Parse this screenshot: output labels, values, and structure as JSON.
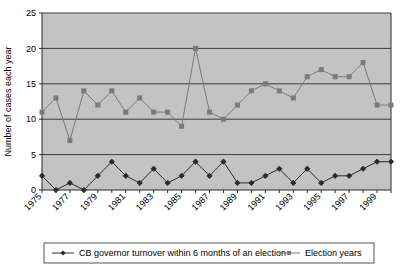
{
  "chart_data": {
    "type": "line",
    "title": "",
    "xlabel": "",
    "ylabel": "Number of cases each year",
    "ylim": [
      0,
      25
    ],
    "ytick_labels": [
      "0",
      "5",
      "10",
      "15",
      "20",
      "25"
    ],
    "yticks": [
      0,
      5,
      10,
      15,
      20,
      25
    ],
    "grid": "horizontal",
    "legend_position": "bottom",
    "plot_background": "#c3c3c3",
    "x": [
      1975,
      1976,
      1977,
      1978,
      1979,
      1980,
      1981,
      1982,
      1983,
      1984,
      1985,
      1986,
      1987,
      1988,
      1989,
      1990,
      1991,
      1992,
      1993,
      1994,
      1995,
      1996,
      1997,
      1998,
      1999,
      2000
    ],
    "xtick_labels": [
      "1975",
      "1977",
      "1979",
      "1981",
      "1983",
      "1985",
      "1987",
      "1989",
      "1991",
      "1993",
      "1995",
      "1997",
      "1999"
    ],
    "xtick_values": [
      1975,
      1977,
      1979,
      1981,
      1983,
      1985,
      1987,
      1989,
      1991,
      1993,
      1995,
      1997,
      1999
    ],
    "series": [
      {
        "name": "CB governor turnover within 6 months of an election",
        "marker": "diamond",
        "color": "#2b2b2b",
        "values": [
          2,
          0,
          1,
          0,
          2,
          4,
          2,
          1,
          3,
          1,
          2,
          4,
          2,
          4,
          1,
          1,
          2,
          3,
          1,
          3,
          1,
          2,
          2,
          3,
          4,
          4
        ]
      },
      {
        "name": "Election years",
        "marker": "square",
        "color": "#7a7a7a",
        "values": [
          11,
          13,
          7,
          14,
          12,
          14,
          11,
          13,
          11,
          11,
          9,
          20,
          11,
          10,
          12,
          14,
          15,
          14,
          13,
          16,
          17,
          16,
          16,
          18,
          12,
          12
        ]
      }
    ]
  },
  "legend": {
    "entry1_label": "CB governor turnover within 6 months of an election",
    "entry2_label": "Election years"
  }
}
